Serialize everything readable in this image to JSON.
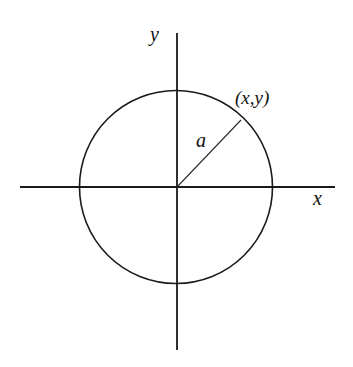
{
  "diagram": {
    "type": "circle-on-cartesian-axes",
    "labels": {
      "y_axis": "y",
      "x_axis": "x",
      "point": "(x,y)",
      "radius": "a"
    },
    "colors": {
      "stroke": "#1a1a1a",
      "background": "#ffffff",
      "text": "#111111"
    },
    "geometry": {
      "origin": [
        177,
        187
      ],
      "radius_px": 97,
      "point_on_circle": [
        241,
        120
      ],
      "x_axis_extent": [
        20,
        335
      ],
      "y_axis_extent": [
        33,
        350
      ]
    }
  }
}
